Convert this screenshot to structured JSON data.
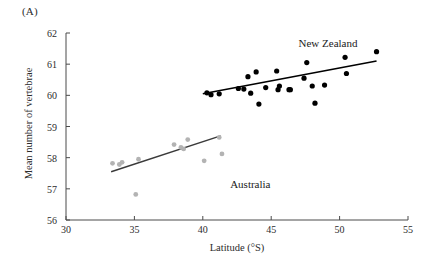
{
  "figure": {
    "panel_label": "(A)",
    "background_color": "#ffffff"
  },
  "chart_data": {
    "type": "scatter",
    "title": "",
    "xlabel": "Latitude (°S)",
    "ylabel": "Mean number of vertebrae",
    "xlim": [
      30,
      55
    ],
    "ylim": [
      56,
      62
    ],
    "xticks": [
      30,
      35,
      40,
      45,
      50,
      55
    ],
    "yticks": [
      56,
      57,
      58,
      59,
      60,
      61,
      62
    ],
    "grid": false,
    "legend": "inline-annotations",
    "series": [
      {
        "name": "New Zealand",
        "color": "#000000",
        "marker": "filled-circle",
        "label_position": {
          "x": 47.0,
          "y": 61.65
        },
        "points": [
          {
            "x": 40.3,
            "y": 60.08
          },
          {
            "x": 40.6,
            "y": 60.02
          },
          {
            "x": 41.2,
            "y": 60.05
          },
          {
            "x": 42.6,
            "y": 60.22
          },
          {
            "x": 43.0,
            "y": 60.2
          },
          {
            "x": 43.3,
            "y": 60.6
          },
          {
            "x": 43.5,
            "y": 60.07
          },
          {
            "x": 43.9,
            "y": 60.75
          },
          {
            "x": 44.1,
            "y": 59.72
          },
          {
            "x": 44.6,
            "y": 60.25
          },
          {
            "x": 45.4,
            "y": 60.78
          },
          {
            "x": 45.5,
            "y": 60.18
          },
          {
            "x": 45.6,
            "y": 60.3
          },
          {
            "x": 46.3,
            "y": 60.18
          },
          {
            "x": 46.4,
            "y": 60.18
          },
          {
            "x": 47.4,
            "y": 60.55
          },
          {
            "x": 47.6,
            "y": 61.05
          },
          {
            "x": 48.0,
            "y": 60.3
          },
          {
            "x": 48.2,
            "y": 59.75
          },
          {
            "x": 48.9,
            "y": 60.33
          },
          {
            "x": 50.4,
            "y": 61.22
          },
          {
            "x": 50.5,
            "y": 60.7
          },
          {
            "x": 52.7,
            "y": 61.4
          }
        ],
        "trendline": {
          "x0": 40.0,
          "y0": 60.05,
          "x1": 52.7,
          "y1": 61.1
        }
      },
      {
        "name": "Australia",
        "color": "#b3b3b3",
        "marker": "filled-circle",
        "label_position": {
          "x": 42.0,
          "y": 57.12
        },
        "points": [
          {
            "x": 33.4,
            "y": 57.82
          },
          {
            "x": 33.9,
            "y": 57.78
          },
          {
            "x": 34.1,
            "y": 57.85
          },
          {
            "x": 35.1,
            "y": 56.82
          },
          {
            "x": 35.3,
            "y": 57.95
          },
          {
            "x": 37.9,
            "y": 58.42
          },
          {
            "x": 38.4,
            "y": 58.33
          },
          {
            "x": 38.6,
            "y": 58.28
          },
          {
            "x": 38.9,
            "y": 58.58
          },
          {
            "x": 40.1,
            "y": 57.9
          },
          {
            "x": 41.2,
            "y": 58.65
          },
          {
            "x": 41.4,
            "y": 58.12
          }
        ],
        "trendline": {
          "x0": 33.3,
          "y0": 57.55,
          "x1": 41.3,
          "y1": 58.7
        }
      }
    ]
  },
  "axes": {
    "x_tick_labels": [
      "30",
      "35",
      "40",
      "45",
      "50",
      "55"
    ],
    "y_tick_labels": [
      "56",
      "57",
      "58",
      "59",
      "60",
      "61",
      "62"
    ]
  }
}
